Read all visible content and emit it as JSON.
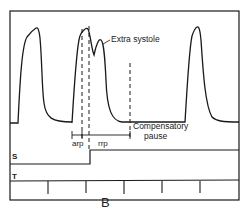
{
  "diagram": {
    "annotations": {
      "extra_systole": "Extra systole",
      "compensatory_line1": "Compensatory",
      "compensatory_line2": "pause",
      "arp": "arp",
      "rrp": "rrp"
    },
    "channels": {
      "s": "S",
      "t": "T",
      "b": "B"
    },
    "colors": {
      "ink": "#1a1a1a",
      "background": "#ffffff"
    }
  }
}
